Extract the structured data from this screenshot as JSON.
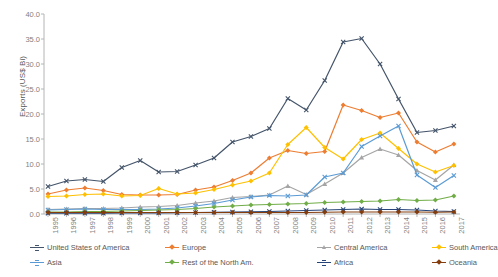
{
  "chart_data": {
    "type": "line",
    "title": "",
    "xlabel": "",
    "ylabel": "Exports (US$ Bi)",
    "ylim": [
      0.0,
      40.0
    ],
    "yticks": [
      "0.0",
      "5.0",
      "10.0",
      "15.0",
      "20.0",
      "25.0",
      "30.0",
      "35.0",
      "40.0"
    ],
    "ytick_values": [
      0,
      5,
      10,
      15,
      20,
      25,
      30,
      35,
      40
    ],
    "grid": false,
    "legend_position": "bottom",
    "categories": [
      "1995",
      "1996",
      "1997",
      "1998",
      "1999",
      "2000",
      "2001",
      "2002",
      "2003",
      "2004",
      "2005",
      "2006",
      "2007",
      "2008",
      "2009",
      "2010",
      "2011",
      "2012",
      "2013",
      "2014",
      "2015",
      "2016",
      "2017"
    ],
    "series": [
      {
        "name": "United States of America",
        "color": "#44546a",
        "marker": "x",
        "values": [
          5.5,
          6.6,
          6.9,
          6.5,
          9.3,
          10.7,
          8.4,
          8.5,
          9.8,
          11.2,
          14.4,
          15.5,
          17.1,
          23.1,
          20.8,
          26.7,
          34.4,
          35.1,
          30.0,
          23.0,
          16.3,
          16.7,
          17.6
        ]
      },
      {
        "name": "Europe",
        "color": "#ed7d31",
        "marker": "diamond",
        "values": [
          4.0,
          4.8,
          5.2,
          4.7,
          3.9,
          3.8,
          3.8,
          3.9,
          4.8,
          5.4,
          6.7,
          8.2,
          11.2,
          12.7,
          12.1,
          12.5,
          21.8,
          20.7,
          19.3,
          20.2,
          14.4,
          12.4,
          14.0
        ]
      },
      {
        "name": "Central America",
        "color": "#a5a5a5",
        "marker": "triangle",
        "values": [
          0.9,
          1.0,
          1.1,
          1.1,
          1.2,
          1.4,
          1.5,
          1.7,
          2.2,
          2.6,
          3.3,
          3.5,
          3.8,
          5.6,
          3.9,
          6.0,
          8.2,
          11.3,
          13.0,
          11.8,
          8.7,
          6.8,
          9.8
        ]
      },
      {
        "name": "South America",
        "color": "#ffc000",
        "marker": "diamond",
        "values": [
          3.5,
          3.6,
          3.9,
          4.0,
          3.6,
          3.7,
          5.1,
          4.0,
          4.2,
          4.9,
          5.8,
          6.6,
          8.2,
          13.9,
          17.3,
          13.3,
          11.0,
          14.9,
          16.2,
          13.1,
          10.0,
          8.4,
          9.7
        ]
      },
      {
        "name": "Asia",
        "color": "#5b9bd5",
        "marker": "x",
        "values": [
          0.8,
          0.9,
          1.0,
          0.9,
          0.9,
          0.9,
          1.0,
          1.2,
          1.6,
          2.1,
          2.8,
          3.4,
          3.7,
          3.6,
          3.8,
          7.4,
          8.2,
          13.5,
          15.6,
          17.6,
          7.8,
          5.3,
          7.7
        ]
      },
      {
        "name": "Rest of the North Am.",
        "color": "#70ad47",
        "marker": "diamond",
        "values": [
          0.4,
          0.4,
          0.5,
          0.5,
          0.6,
          0.7,
          0.8,
          0.9,
          1.1,
          1.4,
          1.6,
          1.8,
          1.9,
          2.0,
          2.1,
          2.3,
          2.4,
          2.5,
          2.6,
          2.9,
          2.7,
          2.8,
          3.6
        ]
      },
      {
        "name": "Africa",
        "color": "#264478",
        "marker": "x",
        "values": [
          0.15,
          0.15,
          0.15,
          0.15,
          0.2,
          0.2,
          0.2,
          0.25,
          0.3,
          0.35,
          0.4,
          0.45,
          0.5,
          0.6,
          0.7,
          0.8,
          0.9,
          1.0,
          0.9,
          0.9,
          0.8,
          0.6,
          0.5
        ]
      },
      {
        "name": "Oceania",
        "color": "#843c0c",
        "marker": "diamond",
        "values": [
          0.3,
          0.3,
          0.3,
          0.3,
          0.3,
          0.3,
          0.3,
          0.3,
          0.3,
          0.3,
          0.3,
          0.3,
          0.3,
          0.3,
          0.3,
          0.35,
          0.4,
          0.4,
          0.4,
          0.4,
          0.4,
          0.35,
          0.4
        ]
      }
    ]
  },
  "axis": {
    "y_title": "Exports (US$ Bi)"
  }
}
